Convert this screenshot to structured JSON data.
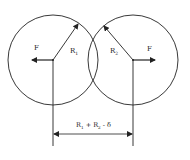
{
  "diagram": {
    "type": "two overlapping circles with forces",
    "left_circle": {
      "radius_label": "R",
      "radius_subscript": "1",
      "force_label": "F",
      "force_direction": "left"
    },
    "right_circle": {
      "radius_label": "R",
      "radius_subscript": "2",
      "force_label": "F",
      "force_direction": "right"
    },
    "dimension": {
      "label": "R₁ + R₂ - δ",
      "parts": [
        "R",
        "1",
        " + R",
        "2",
        " - δ"
      ]
    },
    "colors": {
      "stroke": "#222222",
      "background": "#ffffff"
    }
  }
}
